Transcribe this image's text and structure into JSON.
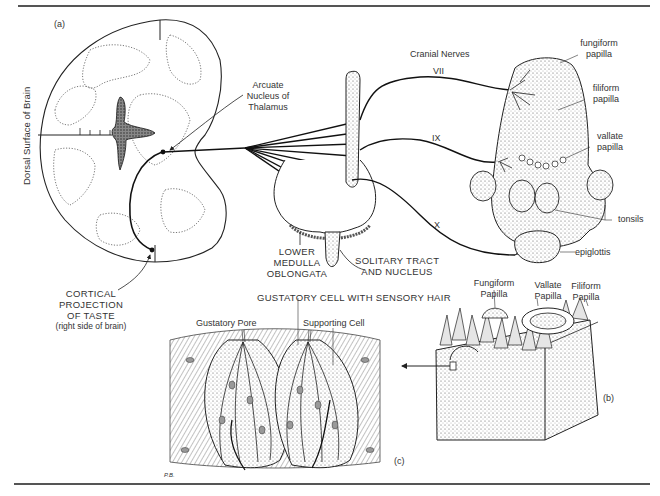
{
  "figure": {
    "panels": {
      "a": "(a)",
      "b": "(b)",
      "c": "(c)"
    },
    "artist_signature": "P.B."
  },
  "panel_a": {
    "side_label": "Dorsal Surface of Brain",
    "thalamus_label": [
      "Arcuate",
      "Nucleus of",
      "Thalamus"
    ],
    "cortical_label": [
      "CORTICAL",
      "PROJECTION",
      "OF TASTE",
      "(right side of brain)"
    ],
    "medulla_label": [
      "LOWER",
      "MEDULLA",
      "OBLONGATA"
    ],
    "solitary_label": [
      "SOLITARY TRACT",
      "AND NUCLEUS"
    ],
    "cranial_nerves_title": "Cranial Nerves",
    "nerves": [
      "VII",
      "IX",
      "X"
    ],
    "tongue_labels": {
      "fungiform": [
        "fungiform",
        "papilla"
      ],
      "filiform": [
        "filiform",
        "papilla"
      ],
      "vallate": [
        "vallate",
        "papilla"
      ],
      "tonsils": "tonsils",
      "epiglottis": "epiglottis"
    }
  },
  "panel_b": {
    "labels": {
      "fungiform": [
        "Fungiform",
        "Papilla"
      ],
      "vallate": [
        "Vallate",
        "Papilla"
      ],
      "filiform": [
        "Filiform",
        "Papilla"
      ]
    }
  },
  "panel_c": {
    "title": "GUSTATORY CELL WITH SENSORY HAIR",
    "gustatory_pore": "Gustatory Pore",
    "supporting_cell": "Supporting Cell"
  }
}
